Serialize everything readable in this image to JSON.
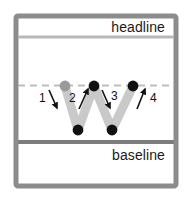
{
  "figure": {
    "type": "letter-stroke-order-diagram",
    "letter": "W"
  },
  "guides": {
    "headline_label": "headline",
    "baseline_label": "baseline",
    "headline_y": 37,
    "xheight_y": 85,
    "baseline_y": 142,
    "headline_style": "solid",
    "xheight_style": "dashed",
    "baseline_style": "solid"
  },
  "strokes": [
    {
      "number": "1",
      "direction": "down-right",
      "from": "top-left",
      "to": "bottom-left"
    },
    {
      "number": "2",
      "direction": "up-right",
      "from": "bottom-left",
      "to": "top-middle"
    },
    {
      "number": "3",
      "direction": "down-right",
      "from": "top-middle",
      "to": "bottom-right"
    },
    {
      "number": "4",
      "direction": "up-right",
      "from": "bottom-right",
      "to": "top-right"
    }
  ],
  "points": [
    {
      "id": "start",
      "x": 65,
      "y": 86,
      "role": "start-point",
      "color": "#9a9a9a"
    },
    {
      "id": "node-2",
      "x": 78,
      "y": 130,
      "role": "vertex",
      "color": "#111111"
    },
    {
      "id": "node-3",
      "x": 94,
      "y": 86,
      "role": "vertex",
      "color": "#111111"
    },
    {
      "id": "node-4",
      "x": 112,
      "y": 130,
      "role": "vertex",
      "color": "#111111"
    },
    {
      "id": "node-5",
      "x": 133,
      "y": 86,
      "role": "end-point",
      "color": "#111111"
    }
  ],
  "colors": {
    "frame": "#8c8c8c",
    "background": "#ffffff",
    "letter_stroke": "#c9c9c9",
    "guide_line_strong": "#7d7d7d",
    "guide_line_soft": "#b8b8b8",
    "guide_line_dashed": "#bdbdbd",
    "dot_dark": "#111111",
    "dot_start": "#9a9a9a",
    "arrow": "#111111",
    "text": "#1a1a1a"
  }
}
